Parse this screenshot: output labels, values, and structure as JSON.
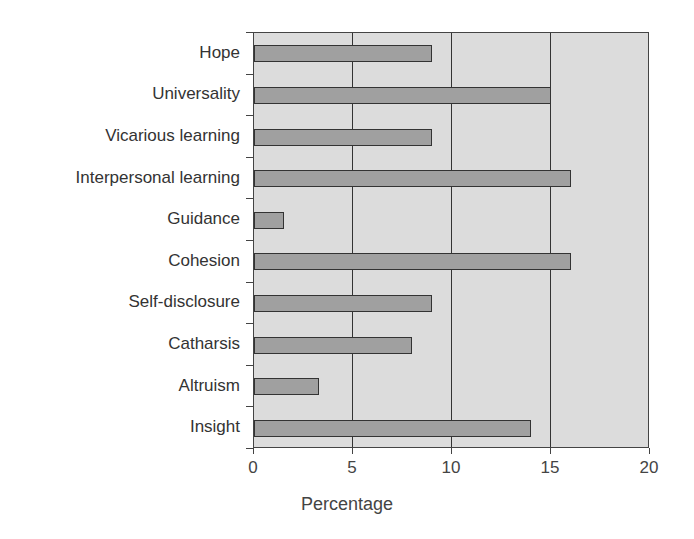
{
  "chart_data": {
    "type": "bar",
    "orientation": "horizontal",
    "title": "",
    "xlabel": "Percentage",
    "ylabel": "",
    "xlim": [
      0,
      20
    ],
    "xticks": [
      "0",
      "5",
      "10",
      "15",
      "20"
    ],
    "grid": "vertical lines at 5, 10, 15",
    "categories": [
      "Hope",
      "Universality",
      "Vicarious learning",
      "Interpersonal learning",
      "Guidance",
      "Cohesion",
      "Self-disclosure",
      "Catharsis",
      "Altruism",
      "Insight"
    ],
    "values": [
      9,
      15,
      9,
      16,
      1.5,
      16,
      9,
      8,
      3.3,
      14
    ],
    "colors": {
      "bar": "#a0a0a0",
      "plot_bg": "#dcdcdc",
      "border": "#333333"
    }
  },
  "labels": {
    "categories": [
      "Hope",
      "Universality",
      "Vicarious learning",
      "Interpersonal learning",
      "Guidance",
      "Cohesion",
      "Self-disclosure",
      "Catharsis",
      "Altruism",
      "Insight"
    ],
    "xticks": [
      "0",
      "5",
      "10",
      "15",
      "20"
    ],
    "xlabel": "Percentage"
  }
}
